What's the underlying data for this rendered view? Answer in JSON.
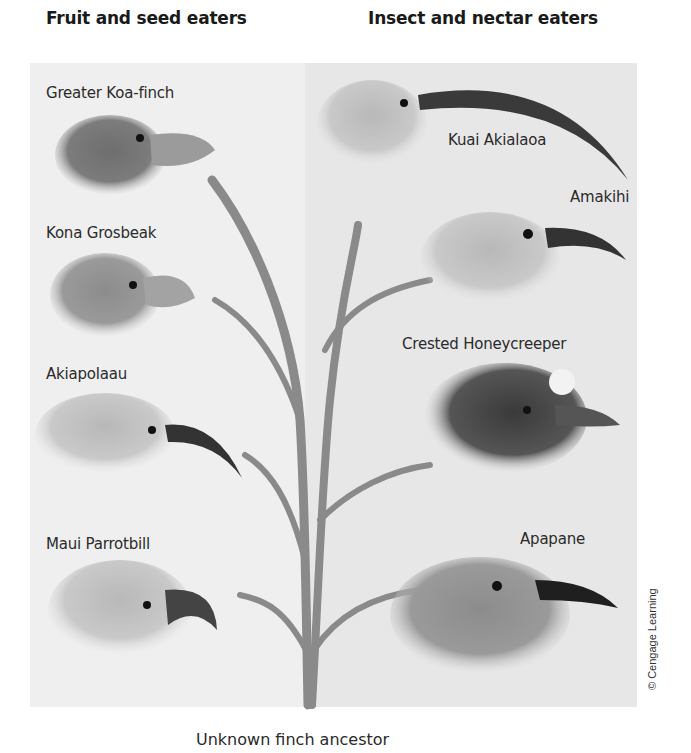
{
  "headers": {
    "left": "Fruit and seed eaters",
    "right": "Insect and nectar eaters"
  },
  "birds_left": [
    {
      "name": "Greater Koa-finch"
    },
    {
      "name": "Kona Grosbeak"
    },
    {
      "name": "Akiapolaau"
    },
    {
      "name": "Maui Parrotbill"
    }
  ],
  "birds_right": [
    {
      "name": "Kuai Akialaoa"
    },
    {
      "name": "Amakihi"
    },
    {
      "name": "Crested Honeycreeper"
    },
    {
      "name": "Apapane"
    }
  ],
  "root_label": "Unknown finch ancestor",
  "credit": "© Cengage Learning",
  "colors": {
    "panel_left": "#efefef",
    "panel_right": "#e7e7e7",
    "stem": "#8a8a8a"
  }
}
